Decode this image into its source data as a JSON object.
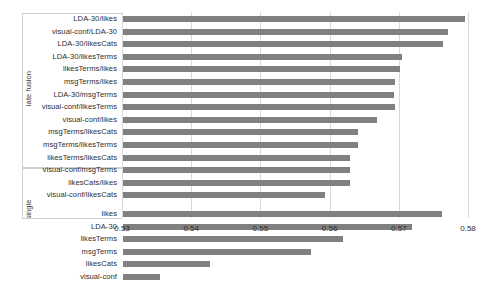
{
  "chart_data": {
    "type": "bar",
    "orientation": "horizontal",
    "title": "",
    "xlabel": "",
    "ylabel": "",
    "xlim": [
      0.53,
      0.58
    ],
    "xticks": [
      0.53,
      0.54,
      0.55,
      0.56,
      0.57,
      0.58
    ],
    "xtick_labels": [
      "0.53",
      "0.54",
      "0.55",
      "0.56",
      "0.57",
      "0.58"
    ],
    "grid": true,
    "grid_axis": "x",
    "legend": false,
    "bar_color": "#808080",
    "groups": [
      {
        "label": "late fusion",
        "categories": [
          "LDA-30/likes",
          "visual-conf/LDA-30",
          "LDA-30/likesCats",
          "LDA-30/likesTerms",
          "likesTerms/likes",
          "msgTerms/likes",
          "LDA-30/msgTerms",
          "visual-conf/likesTerms",
          "visual-conf/likes",
          "msgTerms/likesCats",
          "msgTerms/likesTerms",
          "likesTerms/likesCats",
          "visual-conf/msgTerms",
          "likesCats/likes",
          "visual-conf/likesCats"
        ],
        "values": [
          0.5796,
          0.5771,
          0.5764,
          0.5705,
          0.5702,
          0.5695,
          0.5693,
          0.5695,
          0.5668,
          0.5641,
          0.5641,
          0.563,
          0.563,
          0.563,
          0.5594
        ]
      },
      {
        "label": "single",
        "categories": [
          "likes",
          "LDA-30",
          "likesTerms",
          "msgTerms",
          "likesCats",
          "visual-conf"
        ],
        "values": [
          0.5762,
          0.5719,
          0.562,
          0.5573,
          0.5427,
          0.5355
        ]
      }
    ]
  }
}
